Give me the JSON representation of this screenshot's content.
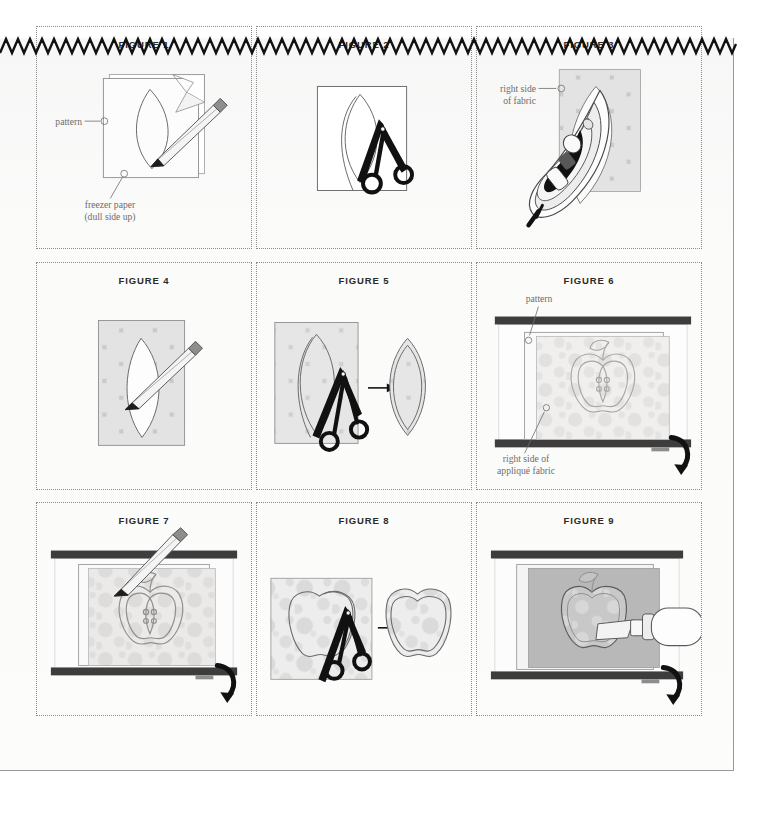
{
  "page": {
    "background_color": "#fbfbfa",
    "border_color": "#9a9a9a",
    "top_edge_style": "zigzag-sawtooth",
    "zigzag_color": "#111111"
  },
  "palette": {
    "title_color": "#2a2a2a",
    "label_color": "#6d6d6d",
    "cell_border_color": "#8c8c8c",
    "outline_color": "#555555",
    "fabric_base": "#c9c9c9",
    "fabric_dot": "#e2e2e2",
    "fabric_base_light": "#dcdcdc",
    "fabric_dot_light": "#cfcfcf",
    "paper_white": "#ffffff",
    "scissors_black": "#111111",
    "lightbox_frame": "#3d3d3d",
    "pencil_body": "#f2f2f2",
    "pencil_eraser": "#8a8a8a",
    "arrow_color": "#111111"
  },
  "figures": [
    {
      "id": "figure-1",
      "title": "FIGURE 1",
      "scene": "pattern-sheet-over-freezer-paper-traced-with-pencil",
      "shape": "leaf",
      "labels": [
        {
          "text": "pattern",
          "anchor": "left"
        },
        {
          "text": "freezer paper",
          "anchor": "bottom"
        },
        {
          "text": "(dull side up)",
          "anchor": "bottom"
        }
      ],
      "has_pencil": true,
      "has_scissors": false,
      "has_arrow": false,
      "has_fabric": false
    },
    {
      "id": "figure-2",
      "title": "FIGURE 2",
      "scene": "cutting-leaf-shape-from-paper-with-scissors",
      "shape": "leaf",
      "labels": [],
      "has_pencil": false,
      "has_scissors": true,
      "has_arrow": false,
      "has_fabric": false
    },
    {
      "id": "figure-3",
      "title": "FIGURE 3",
      "scene": "iron-pressing-freezer-paper-leaf-onto-fabric",
      "shape": "leaf",
      "labels": [
        {
          "text": "right side",
          "anchor": "left"
        },
        {
          "text": "of fabric",
          "anchor": "left"
        }
      ],
      "has_pencil": false,
      "has_scissors": false,
      "has_arrow": false,
      "has_fabric": true
    },
    {
      "id": "figure-4",
      "title": "FIGURE 4",
      "scene": "tracing-around-leaf-template-on-fabric-with-pencil",
      "shape": "leaf",
      "labels": [],
      "has_pencil": true,
      "has_scissors": false,
      "has_arrow": false,
      "has_fabric": true
    },
    {
      "id": "figure-5",
      "title": "FIGURE 5",
      "scene": "cutting-leaf-from-fabric-then-finished-leaf-piece",
      "shape": "leaf",
      "labels": [],
      "has_pencil": false,
      "has_scissors": true,
      "has_arrow": true,
      "has_fabric": true
    },
    {
      "id": "figure-6",
      "title": "FIGURE 6",
      "scene": "pattern-and-applique-fabric-on-light-box",
      "shape": "apple",
      "labels": [
        {
          "text": "pattern",
          "anchor": "top"
        },
        {
          "text": "right side of",
          "anchor": "bottom"
        },
        {
          "text": "appliqué fabric",
          "anchor": "bottom"
        }
      ],
      "has_pencil": false,
      "has_scissors": false,
      "has_arrow": false,
      "has_fabric": true,
      "has_lightbox": true,
      "has_curved_arrow": true
    },
    {
      "id": "figure-7",
      "title": "FIGURE 7",
      "scene": "tracing-apple-pattern-on-light-box-with-pencil",
      "shape": "apple",
      "labels": [],
      "has_pencil": true,
      "has_scissors": false,
      "has_arrow": false,
      "has_fabric": true,
      "has_lightbox": true,
      "has_curved_arrow": true
    },
    {
      "id": "figure-8",
      "title": "FIGURE 8",
      "scene": "cutting-apple-from-fabric-then-finished-apple-piece",
      "shape": "apple",
      "labels": [],
      "has_pencil": false,
      "has_scissors": true,
      "has_arrow": true,
      "has_fabric": true
    },
    {
      "id": "figure-9",
      "title": "FIGURE 9",
      "scene": "mini-iron-pressing-applique-apple-on-light-box",
      "shape": "apple",
      "labels": [],
      "has_pencil": false,
      "has_scissors": false,
      "has_arrow": false,
      "has_fabric": true,
      "has_lightbox": true,
      "has_curved_arrow": true,
      "has_mini_iron": true
    }
  ]
}
